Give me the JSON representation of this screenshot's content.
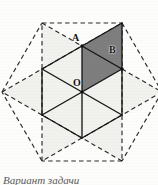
{
  "figure": {
    "type": "geometry-diagram",
    "canvas": {
      "width": 158,
      "height": 185,
      "background": "#fdfdfb"
    },
    "center": {
      "name": "O",
      "x": 82,
      "y": 92
    },
    "labels": [
      {
        "id": "A",
        "text": "A",
        "x": 72,
        "y": 33
      },
      {
        "id": "B",
        "text": "B",
        "x": 109,
        "y": 45
      },
      {
        "id": "O",
        "text": "O",
        "x": 73,
        "y": 78
      }
    ],
    "colors": {
      "stroke_solid": "#151515",
      "stroke_dashed": "#2a2a2a",
      "fill_shaded": "#7e7e7e",
      "fill_light": "#f1f1ee",
      "background": "#fdfdfb",
      "label_color": "#121212"
    },
    "hexagon": {
      "radius": 46,
      "vertices": [
        {
          "name": "A",
          "x": 82,
          "y": 46
        },
        {
          "name": "B",
          "x": 122,
          "y": 69
        },
        {
          "name": "C",
          "x": 122,
          "y": 115
        },
        {
          "name": "D",
          "x": 82,
          "y": 138
        },
        {
          "name": "E",
          "x": 42,
          "y": 115
        },
        {
          "name": "F",
          "x": 42,
          "y": 69
        }
      ]
    },
    "star_points": [
      {
        "name": "P1",
        "x": 122,
        "y": 23
      },
      {
        "name": "P2",
        "x": 162,
        "y": 92
      },
      {
        "name": "P3",
        "x": 122,
        "y": 161
      },
      {
        "name": "P4",
        "x": 42,
        "y": 161
      },
      {
        "name": "P5",
        "x": 2,
        "y": 92
      },
      {
        "name": "P6",
        "x": 42,
        "y": 23
      }
    ],
    "shaded_region": {
      "name": "quadrilateral-OAP1B",
      "points": "82,92 82,46 122,23 122,69",
      "fill": "#7e7e7e"
    },
    "light_regions": [
      {
        "name": "star-point-top-left",
        "points": "42,23 82,46 42,69"
      },
      {
        "name": "star-point-left",
        "points": "2,92 42,69 42,115"
      },
      {
        "name": "star-point-bottom-left",
        "points": "42,161 42,115 82,138"
      },
      {
        "name": "star-point-bottom-right",
        "points": "122,161 82,138 122,115"
      },
      {
        "name": "star-point-right",
        "points": "162,92 122,115 122,69"
      },
      {
        "name": "hexagon-body",
        "points": "82,46 122,69 122,115 82,138 42,115 42,69"
      }
    ],
    "solid_edges": [
      {
        "name": "edge-AB",
        "x1": 82,
        "y1": 46,
        "x2": 122,
        "y2": 69
      },
      {
        "name": "edge-BC",
        "x1": 122,
        "y1": 69,
        "x2": 122,
        "y2": 115
      },
      {
        "name": "edge-CD",
        "x1": 122,
        "y1": 115,
        "x2": 82,
        "y2": 138
      },
      {
        "name": "edge-DE",
        "x1": 82,
        "y1": 138,
        "x2": 42,
        "y2": 115
      },
      {
        "name": "edge-EF",
        "x1": 42,
        "y1": 115,
        "x2": 42,
        "y2": 69
      },
      {
        "name": "edge-FA",
        "x1": 42,
        "y1": 69,
        "x2": 82,
        "y2": 46
      },
      {
        "name": "radius-OA",
        "x1": 82,
        "y1": 92,
        "x2": 82,
        "y2": 46
      },
      {
        "name": "radius-OB",
        "x1": 82,
        "y1": 92,
        "x2": 122,
        "y2": 69
      },
      {
        "name": "radius-OC",
        "x1": 82,
        "y1": 92,
        "x2": 122,
        "y2": 115
      },
      {
        "name": "radius-OD",
        "x1": 82,
        "y1": 92,
        "x2": 82,
        "y2": 138
      },
      {
        "name": "radius-OE",
        "x1": 82,
        "y1": 92,
        "x2": 42,
        "y2": 115
      },
      {
        "name": "radius-OF",
        "x1": 82,
        "y1": 92,
        "x2": 42,
        "y2": 69
      },
      {
        "name": "chord-AP1",
        "x1": 82,
        "y1": 46,
        "x2": 122,
        "y2": 23
      },
      {
        "name": "chord-P1B",
        "x1": 122,
        "y1": 23,
        "x2": 122,
        "y2": 69
      }
    ],
    "dashed_edges": [
      {
        "name": "star-chord-1",
        "x1": 42,
        "y1": 23,
        "x2": 122,
        "y2": 23
      },
      {
        "name": "star-chord-2",
        "x1": 122,
        "y1": 23,
        "x2": 162,
        "y2": 92
      },
      {
        "name": "star-chord-3",
        "x1": 162,
        "y1": 92,
        "x2": 122,
        "y2": 161
      },
      {
        "name": "star-chord-4",
        "x1": 122,
        "y1": 161,
        "x2": 42,
        "y2": 161
      },
      {
        "name": "star-chord-5",
        "x1": 42,
        "y1": 161,
        "x2": 2,
        "y2": 92
      },
      {
        "name": "star-chord-6",
        "x1": 2,
        "y1": 92,
        "x2": 42,
        "y2": 23
      },
      {
        "name": "star-long-1",
        "x1": 42,
        "y1": 23,
        "x2": 162,
        "y2": 92
      },
      {
        "name": "star-long-2",
        "x1": 122,
        "y1": 23,
        "x2": 122,
        "y2": 161
      },
      {
        "name": "star-long-3",
        "x1": 162,
        "y1": 92,
        "x2": 42,
        "y2": 161
      },
      {
        "name": "star-long-4",
        "x1": 122,
        "y1": 161,
        "x2": 2,
        "y2": 92
      },
      {
        "name": "star-long-5",
        "x1": 42,
        "y1": 161,
        "x2": 42,
        "y2": 23
      },
      {
        "name": "star-long-6",
        "x1": 2,
        "y1": 92,
        "x2": 122,
        "y2": 23
      }
    ],
    "caption": {
      "text": "Bариант задачи"
    }
  }
}
